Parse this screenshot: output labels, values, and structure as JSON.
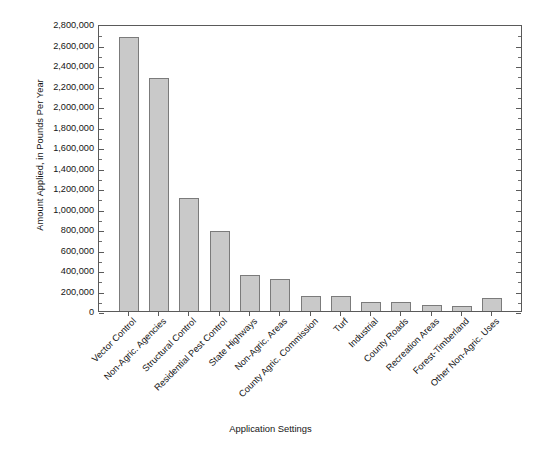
{
  "chart_data": {
    "type": "bar",
    "title": "",
    "xlabel": "Application Settings",
    "ylabel": "Amount Applied, in Pounds Per Year",
    "ylim": [
      0,
      2800000
    ],
    "ytick_step": 200000,
    "minor_ticks_per_interval": 1,
    "grid": false,
    "legend": false,
    "bar_color": "#c9c9c9",
    "bar_edge_color": "#7b7b7b",
    "axis_color": "#5a5a5a",
    "categories": [
      "Vector Control",
      "Non-Agric. Agencies",
      "Structural Control",
      "Residential Pest Control",
      "State Highways",
      "Non-Agric. Areas",
      "County Agric. Commission",
      "Turf",
      "Industrial",
      "County Roads",
      "Recreation Areas",
      "Forest-Timberland",
      "Other Non-Agric. Uses"
    ],
    "values": [
      2670000,
      2270000,
      1100000,
      780000,
      350000,
      310000,
      150000,
      145000,
      85000,
      85000,
      55000,
      50000,
      125000
    ],
    "ytick_labels": [
      "2,800,000",
      "2,600,000",
      "2,400,000",
      "2,200,000",
      "2,000,000",
      "1,800,000",
      "1,600,000",
      "1,400,000",
      "1,200,000",
      "1,000,000",
      "800,000",
      "600,000",
      "400,000",
      "200,000",
      "0"
    ],
    "ytick_values": [
      2800000,
      2600000,
      2400000,
      2200000,
      2000000,
      1800000,
      1600000,
      1400000,
      1200000,
      1000000,
      800000,
      600000,
      400000,
      200000,
      0
    ]
  }
}
